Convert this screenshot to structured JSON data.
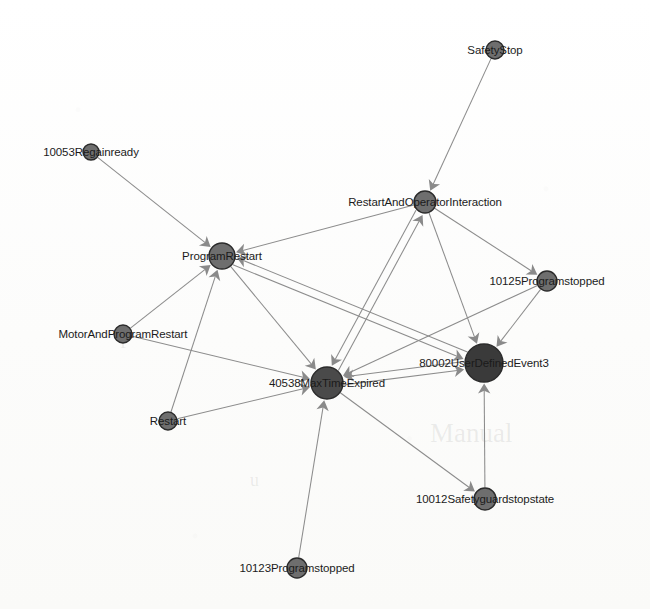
{
  "figure": {
    "type": "directed-graph",
    "width": 650,
    "height": 609,
    "background_color": "#fdfdfc",
    "edge_color": "#8c8c8c",
    "label_color": "#1b1b1b"
  },
  "watermarks": [
    {
      "text": "Manual",
      "x": 430,
      "y": 418,
      "size": 27
    },
    {
      "text": "f",
      "x": 120,
      "y": 330,
      "size": 20
    },
    {
      "text": "u",
      "x": 250,
      "y": 470,
      "size": 18
    }
  ],
  "nodes": [
    {
      "id": "SafetyStop",
      "label": "SafetyStop",
      "x": 495,
      "y": 50,
      "r": 9,
      "fill": "#6e6e6e",
      "label_dx": 0,
      "label_dy": 0
    },
    {
      "id": "10053Regainready",
      "label": "10053Regainready",
      "x": 91,
      "y": 152,
      "r": 8,
      "fill": "#6e6e6e",
      "label_dx": 0,
      "label_dy": 0
    },
    {
      "id": "RestartAndOperatorInteraction",
      "label": "RestartAndOperatorInteraction",
      "x": 425,
      "y": 202,
      "r": 11,
      "fill": "#6e6e6e",
      "label_dx": 0,
      "label_dy": 0
    },
    {
      "id": "ProgramRestart",
      "label": "ProgramRestart",
      "x": 222,
      "y": 256,
      "r": 13,
      "fill": "#6e6e6e",
      "label_dx": 0,
      "label_dy": 0
    },
    {
      "id": "10125Programstopped",
      "label": "10125Programstopped",
      "x": 547,
      "y": 281,
      "r": 10,
      "fill": "#6e6e6e",
      "label_dx": 0,
      "label_dy": 0
    },
    {
      "id": "MotorAndProgramRestart",
      "label": "MotorAndProgramRestart",
      "x": 123,
      "y": 334,
      "r": 9,
      "fill": "#6e6e6e",
      "label_dx": 0,
      "label_dy": 0
    },
    {
      "id": "80002UserDefinedEvent3",
      "label": "80002UserDefinedEvent3",
      "x": 484,
      "y": 363,
      "r": 19,
      "fill": "#3a3a3a",
      "label_dx": 0,
      "label_dy": 0
    },
    {
      "id": "40538MaxTimeExpired",
      "label": "40538MaxTimeExpired",
      "x": 327,
      "y": 383,
      "r": 16,
      "fill": "#4a4a4a",
      "label_dx": 0,
      "label_dy": 0
    },
    {
      "id": "Restart",
      "label": "Restart",
      "x": 168,
      "y": 421,
      "r": 9,
      "fill": "#6e6e6e",
      "label_dx": 0,
      "label_dy": 0
    },
    {
      "id": "10012Safetyguardstopstate",
      "label": "10012Safetyguardstopstate",
      "x": 485,
      "y": 499,
      "r": 11,
      "fill": "#6e6e6e",
      "label_dx": 0,
      "label_dy": 0
    },
    {
      "id": "10123Programstopped",
      "label": "10123Programstopped",
      "x": 297,
      "y": 568,
      "r": 10,
      "fill": "#6e6e6e",
      "label_dx": 0,
      "label_dy": 0
    }
  ],
  "edges": [
    {
      "source": "SafetyStop",
      "target": "RestartAndOperatorInteraction"
    },
    {
      "source": "10053Regainready",
      "target": "ProgramRestart"
    },
    {
      "source": "RestartAndOperatorInteraction",
      "target": "ProgramRestart"
    },
    {
      "source": "RestartAndOperatorInteraction",
      "target": "10125Programstopped"
    },
    {
      "source": "RestartAndOperatorInteraction",
      "target": "80002UserDefinedEvent3"
    },
    {
      "source": "RestartAndOperatorInteraction",
      "target": "40538MaxTimeExpired"
    },
    {
      "source": "40538MaxTimeExpired",
      "target": "RestartAndOperatorInteraction"
    },
    {
      "source": "ProgramRestart",
      "target": "40538MaxTimeExpired"
    },
    {
      "source": "ProgramRestart",
      "target": "80002UserDefinedEvent3"
    },
    {
      "source": "MotorAndProgramRestart",
      "target": "ProgramRestart"
    },
    {
      "source": "MotorAndProgramRestart",
      "target": "40538MaxTimeExpired"
    },
    {
      "source": "Restart",
      "target": "ProgramRestart"
    },
    {
      "source": "Restart",
      "target": "40538MaxTimeExpired"
    },
    {
      "source": "10125Programstopped",
      "target": "80002UserDefinedEvent3"
    },
    {
      "source": "10125Programstopped",
      "target": "40538MaxTimeExpired"
    },
    {
      "source": "40538MaxTimeExpired",
      "target": "80002UserDefinedEvent3"
    },
    {
      "source": "80002UserDefinedEvent3",
      "target": "40538MaxTimeExpired"
    },
    {
      "source": "80002UserDefinedEvent3",
      "target": "ProgramRestart"
    },
    {
      "source": "40538MaxTimeExpired",
      "target": "10012Safetyguardstopstate"
    },
    {
      "source": "10012Safetyguardstopstate",
      "target": "80002UserDefinedEvent3"
    },
    {
      "source": "10123Programstopped",
      "target": "40538MaxTimeExpired"
    }
  ]
}
